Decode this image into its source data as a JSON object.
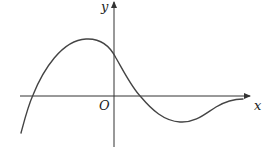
{
  "figure": {
    "type": "function-graph",
    "labels": {
      "y_axis": "y",
      "x_axis": "x",
      "origin": "O"
    },
    "colors": {
      "axis": "#333333",
      "curve": "#444444",
      "background": "#ffffff"
    },
    "curve_description": "Smooth curve rising from lower-left, crossing x-axis left of origin, reaching a local maximum left of the y-axis, crossing the y-axis above the origin, crossing the x-axis right of the origin, reaching a local minimum below the x-axis, then rising toward the x-axis asymptotically on the right."
  }
}
